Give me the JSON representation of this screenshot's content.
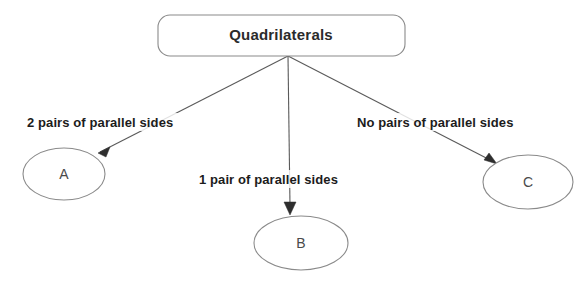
{
  "diagram": {
    "title": "Quadrilaterals",
    "background_color": "#ffffff",
    "root": {
      "label": "Quadrilaterals",
      "shape": "rounded-rectangle",
      "fill_color": "#ffffff",
      "stroke_color": "#8a8a8a"
    },
    "nodes": [
      {
        "id": "A",
        "label": "A",
        "shape": "ellipse",
        "fill_color": "#ffffff",
        "stroke_color": "#8a8a8a"
      },
      {
        "id": "B",
        "label": "B",
        "shape": "ellipse",
        "fill_color": "#ffffff",
        "stroke_color": "#8a8a8a"
      },
      {
        "id": "C",
        "label": "C",
        "shape": "ellipse",
        "fill_color": "#ffffff",
        "stroke_color": "#8a8a8a"
      }
    ],
    "edges": [
      {
        "from": "Quadrilaterals",
        "to": "A",
        "label": "2 pairs of parallel sides",
        "direction": "down-left"
      },
      {
        "from": "Quadrilaterals",
        "to": "B",
        "label": "1 pair of parallel sides",
        "direction": "down"
      },
      {
        "from": "Quadrilaterals",
        "to": "C",
        "label": "No pairs of parallel sides",
        "direction": "down-right"
      }
    ]
  }
}
